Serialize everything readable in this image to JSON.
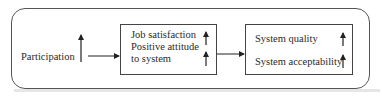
{
  "diagram": {
    "input": {
      "label": "Participation",
      "indicator": "up-arrow"
    },
    "middle": {
      "lines": [
        "Job satisfaction",
        "Positive attitude",
        "to system"
      ],
      "indicators": [
        "up-arrow",
        "up-arrow"
      ]
    },
    "output": {
      "lines": [
        "System quality",
        "System acceptability"
      ],
      "indicators": [
        "up-arrow",
        "up-arrow"
      ]
    },
    "flow": [
      "Participation",
      "Job satisfaction / Positive attitude to system",
      "System quality / System acceptability"
    ]
  }
}
